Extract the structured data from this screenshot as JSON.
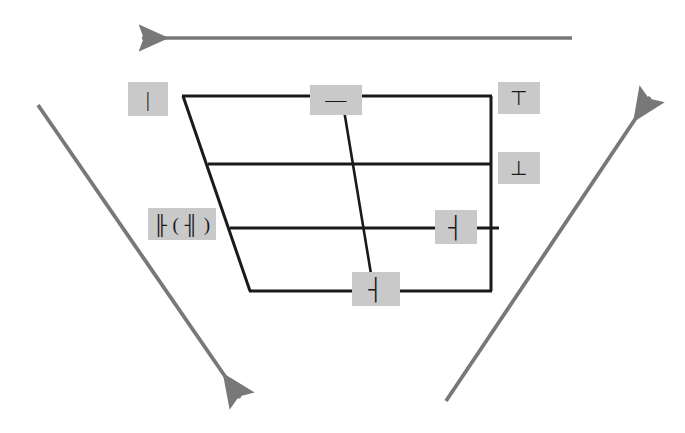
{
  "figure": {
    "background_color": "#ffffff",
    "line_color": "#1a1a1a",
    "arrow_color": "#787878",
    "label_box_color": "#c9c9c9",
    "label_text_color": "#1a1a1a"
  },
  "arrows": [
    {
      "name": "top-arrow",
      "label": "",
      "direction": "left",
      "x1": 572,
      "y1": 38,
      "x2": 140,
      "y2": 38,
      "color": "#787878"
    },
    {
      "name": "left-diagonal-arrow",
      "label": "",
      "direction": "down-right",
      "x1": 38,
      "y1": 105,
      "x2": 242,
      "y2": 401,
      "color": "#787878"
    },
    {
      "name": "right-diagonal-arrow",
      "label": "",
      "direction": "up-right",
      "x1": 446,
      "y1": 401,
      "x2": 652,
      "y2": 94,
      "color": "#787878"
    }
  ],
  "shape": {
    "name": "trapezoid",
    "left_edge": {
      "x1": 183,
      "y1": 96,
      "x2": 250,
      "y2": 291
    },
    "right_edge": {
      "x1": 491,
      "y1": 96,
      "x2": 491,
      "y2": 291
    },
    "horizontal_lines": [
      {
        "name": "line-1-top",
        "x1": 183,
        "y1": 96,
        "x2": 491,
        "y2": 96
      },
      {
        "name": "line-2",
        "x1": 208,
        "y1": 164,
        "x2": 491,
        "y2": 164
      },
      {
        "name": "line-3",
        "x1": 230,
        "y1": 228,
        "x2": 498,
        "y2": 228
      },
      {
        "name": "line-4-bottom",
        "x1": 250,
        "y1": 291,
        "x2": 491,
        "y2": 291
      }
    ],
    "diagonal_line": {
      "name": "inner-diagonal",
      "x1": 343,
      "y1": 104,
      "x2": 373,
      "y2": 286
    }
  },
  "labels": [
    {
      "name": "label-top-left",
      "text": "|",
      "position": "top-left"
    },
    {
      "name": "label-top-middle",
      "text": "—",
      "position": "top-middle"
    },
    {
      "name": "label-top-right",
      "text": "⊤",
      "position": "top-right"
    },
    {
      "name": "label-right-upper",
      "text": "⊥",
      "position": "right-upper"
    },
    {
      "name": "label-left-middle",
      "text": "╟ ( ╢ )",
      "position": "left-middle"
    },
    {
      "name": "label-right-mid",
      "text": "┤",
      "position": "right-middle"
    },
    {
      "name": "label-bottom",
      "text": "┤",
      "position": "bottom-center"
    }
  ]
}
